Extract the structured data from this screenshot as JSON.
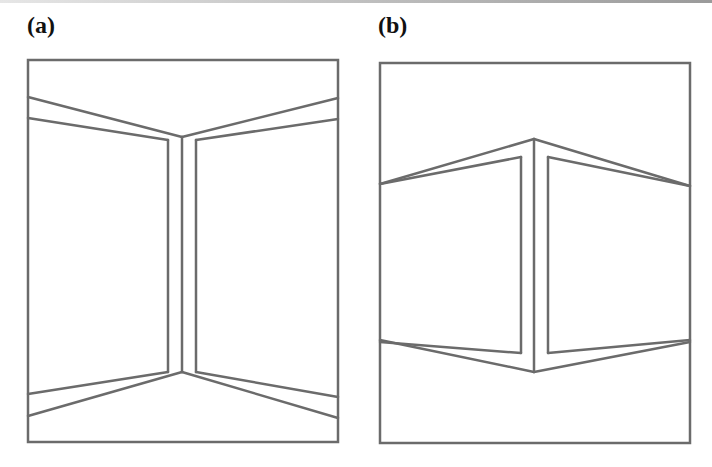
{
  "figure": {
    "stroke_color": "#6b6b6b",
    "panels": [
      {
        "label": "(a)",
        "label_pos": [
          27,
          43
        ],
        "frame": [
          28,
          60,
          338,
          442
        ],
        "lines": [
          [
            28,
            97,
            182,
            137
          ],
          [
            28,
            118,
            168,
            140
          ],
          [
            182,
            137,
            338,
            98
          ],
          [
            196,
            140,
            338,
            119
          ],
          [
            182,
            137,
            182,
            372
          ],
          [
            168,
            140,
            168,
            372
          ],
          [
            196,
            140,
            196,
            372
          ],
          [
            28,
            394,
            168,
            372
          ],
          [
            28,
            416,
            182,
            372
          ],
          [
            196,
            372,
            338,
            397
          ],
          [
            182,
            372,
            338,
            418
          ]
        ]
      },
      {
        "label": "(b)",
        "label_pos": [
          378,
          43
        ],
        "frame": [
          380,
          63,
          690,
          443
        ],
        "lines": [
          [
            380,
            184,
            534,
            139
          ],
          [
            534,
            139,
            690,
            186
          ],
          [
            380,
            184,
            521,
            157
          ],
          [
            548,
            157,
            690,
            186
          ],
          [
            534,
            139,
            534,
            372
          ],
          [
            521,
            157,
            521,
            353
          ],
          [
            548,
            157,
            548,
            353
          ],
          [
            380,
            340,
            534,
            372
          ],
          [
            534,
            372,
            690,
            342
          ],
          [
            380,
            342,
            521,
            353
          ],
          [
            548,
            353,
            690,
            340
          ]
        ]
      }
    ]
  }
}
